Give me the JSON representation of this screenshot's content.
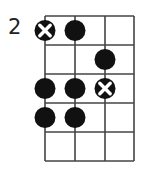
{
  "diagram": {
    "type": "fretboard-chord-diagram",
    "starting_fret_label": "2",
    "strings": 4,
    "frets_shown": 5,
    "grid": {
      "x_lines": [
        45,
        75,
        105,
        134
      ],
      "y_lines": [
        16,
        45,
        74,
        103,
        132,
        161
      ],
      "line_color": "#444444"
    },
    "markers": [
      {
        "string": 1,
        "fret": 1,
        "kind": "root"
      },
      {
        "string": 2,
        "fret": 1,
        "kind": "note"
      },
      {
        "string": 3,
        "fret": 2,
        "kind": "note"
      },
      {
        "string": 1,
        "fret": 3,
        "kind": "note"
      },
      {
        "string": 2,
        "fret": 3,
        "kind": "note"
      },
      {
        "string": 3,
        "fret": 3,
        "kind": "root"
      },
      {
        "string": 1,
        "fret": 4,
        "kind": "note"
      },
      {
        "string": 2,
        "fret": 4,
        "kind": "note"
      }
    ],
    "colors": {
      "dot": "#111111",
      "x_mark": "#ffffff"
    }
  }
}
